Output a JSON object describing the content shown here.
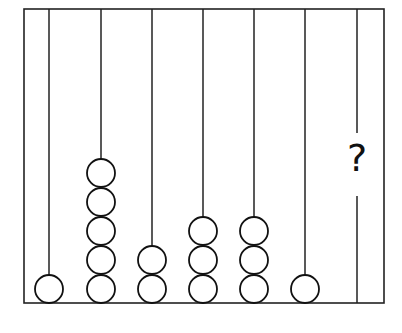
{
  "diagram": {
    "type": "abacus",
    "frame": {
      "left": 24,
      "top": 9,
      "right": 384,
      "bottom": 303,
      "stroke": "#222222"
    },
    "bead": {
      "diameter": 28,
      "step": 29,
      "stroke": "#111111",
      "fill": "#ffffff"
    },
    "rods": [
      {
        "x": 49,
        "beads": 1
      },
      {
        "x": 101,
        "beads": 5
      },
      {
        "x": 152,
        "beads": 2
      },
      {
        "x": 203,
        "beads": 3
      },
      {
        "x": 254,
        "beads": 3
      },
      {
        "x": 305,
        "beads": 1
      },
      {
        "x": 357,
        "beads": null,
        "label": "?",
        "gap_top": 133,
        "gap_bottom": 196
      }
    ]
  },
  "question_mark": "?"
}
